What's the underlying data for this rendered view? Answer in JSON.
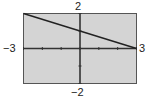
{
  "chart_data": {
    "type": "line",
    "title": "",
    "xlabel": "",
    "ylabel": "",
    "xlim": [
      -3,
      3
    ],
    "ylim": [
      -2,
      2
    ],
    "grid": false,
    "legend": null,
    "tick_labels": {
      "xmin": "−3",
      "xmax": "3",
      "ymin": "−2",
      "ymax": "2"
    },
    "x_ticks": [
      -3,
      -2,
      -1,
      0,
      1,
      2,
      3
    ],
    "y_ticks": [
      -2,
      -1,
      0,
      1,
      2
    ],
    "series": [
      {
        "name": "y = -x/3 + 1",
        "x": [
          -3,
          0,
          3
        ],
        "y": [
          2,
          1,
          0
        ]
      }
    ]
  },
  "style": {
    "plot_background": "#d4d4d4",
    "frame_color": "#555555",
    "axis_color": "#333333",
    "line_color": "#222222"
  }
}
